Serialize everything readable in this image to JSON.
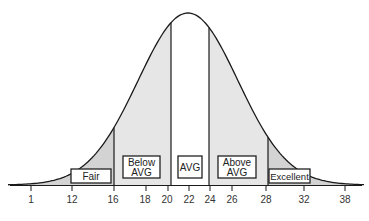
{
  "chart_data": {
    "type": "area",
    "title": "",
    "xlabel": "",
    "ylabel": "",
    "x_ticks": [
      "1",
      "12",
      "16",
      "18",
      "20",
      "22",
      "24",
      "26",
      "28",
      "32",
      "38"
    ],
    "dividers": [
      16,
      20,
      24,
      28
    ],
    "regions": [
      {
        "name": "Fair",
        "label_lines": [
          "Fair"
        ],
        "from": 12,
        "to": 16,
        "shade": "#d3d3d3"
      },
      {
        "name": "Below AVG",
        "label_lines": [
          "Below",
          "AVG"
        ],
        "from": 16,
        "to": 20,
        "shade": "#e6e6e6"
      },
      {
        "name": "AVG",
        "label_lines": [
          "AVG"
        ],
        "from": 20,
        "to": 24,
        "shade": "#ffffff"
      },
      {
        "name": "Above AVG",
        "label_lines": [
          "Above",
          "AVG"
        ],
        "from": 24,
        "to": 28,
        "shade": "#e6e6e6"
      },
      {
        "name": "Excellent",
        "label_lines": [
          "Excellent"
        ],
        "from": 28,
        "to": 32,
        "shade": "#d3d3d3"
      }
    ],
    "grid": false,
    "legend": "none"
  },
  "colors": {
    "curve": "#1a1a1a",
    "tail_fill": "#d3d3d3",
    "mid_fill": "#e6e6e6",
    "center_fill": "#ffffff",
    "box_border": "#222222"
  }
}
